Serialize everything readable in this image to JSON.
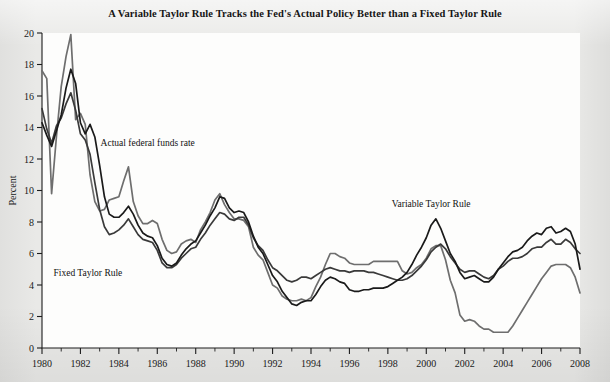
{
  "title": "A Variable Taylor Rule Tracks the Fed's Actual Policy Better than a Fixed Taylor Rule",
  "axes": {
    "ylabel": "Percent",
    "ylim": [
      0,
      20
    ],
    "yticks": [
      0,
      2,
      4,
      6,
      8,
      10,
      12,
      14,
      16,
      18,
      20
    ],
    "ytick_labels": [
      "0",
      "2",
      "4",
      "6",
      "8",
      "10",
      "12",
      "14",
      "16",
      "18",
      "20"
    ],
    "xlim": [
      1980,
      2008
    ],
    "xticks": [
      1980,
      1982,
      1984,
      1986,
      1988,
      1990,
      1992,
      1994,
      1996,
      1998,
      2000,
      2002,
      2004,
      2006,
      2008
    ],
    "xtick_labels": [
      "1980",
      "1982",
      "1984",
      "1986",
      "1988",
      "1990",
      "1992",
      "1994",
      "1996",
      "1998",
      "2000",
      "2002",
      "2004",
      "2006",
      "2008"
    ],
    "xminor_step": 1,
    "grid": false
  },
  "annotations": [
    {
      "name": "actual-federal-funds-rate",
      "text": "Actual federal funds rate",
      "x": 1983.05,
      "y": 12.85
    },
    {
      "name": "fixed-taylor-rule",
      "text": "Fixed Taylor Rule",
      "x": 1980.6,
      "y": 4.55
    },
    {
      "name": "variable-taylor-rule",
      "text": "Variable Taylor Rule",
      "x": 1998.2,
      "y": 8.95
    }
  ],
  "colors": {
    "actual_federal_funds_rate": "#6e6e6e",
    "fixed_taylor_rule": "#3a3a3a",
    "variable_taylor_rule": "#1a1a1a",
    "axis": "#1d1d1d",
    "page_background": "#e9e9e7",
    "plot_background": "#fdfdfc"
  },
  "chart_data": {
    "type": "line",
    "title": "A Variable Taylor Rule Tracks the Fed's Actual Policy Better than a Fixed Taylor Rule",
    "xlabel": "",
    "ylabel": "Percent",
    "xlim": [
      1980,
      2008
    ],
    "ylim": [
      0,
      20
    ],
    "grid": false,
    "legend": "inline-annotations",
    "x": [
      1980.0,
      1980.25,
      1980.5,
      1980.75,
      1981.0,
      1981.25,
      1981.5,
      1981.75,
      1982.0,
      1982.25,
      1982.5,
      1982.75,
      1983.0,
      1983.25,
      1983.5,
      1983.75,
      1984.0,
      1984.25,
      1984.5,
      1984.75,
      1985.0,
      1985.25,
      1985.5,
      1985.75,
      1986.0,
      1986.25,
      1986.5,
      1986.75,
      1987.0,
      1987.25,
      1987.5,
      1987.75,
      1988.0,
      1988.25,
      1988.5,
      1988.75,
      1989.0,
      1989.25,
      1989.5,
      1989.75,
      1990.0,
      1990.25,
      1990.5,
      1990.75,
      1991.0,
      1991.25,
      1991.5,
      1991.75,
      1992.0,
      1992.25,
      1992.5,
      1992.75,
      1993.0,
      1993.25,
      1993.5,
      1993.75,
      1994.0,
      1994.25,
      1994.5,
      1994.75,
      1995.0,
      1995.25,
      1995.5,
      1995.75,
      1996.0,
      1996.25,
      1996.5,
      1996.75,
      1997.0,
      1997.25,
      1997.5,
      1997.75,
      1998.0,
      1998.25,
      1998.5,
      1998.75,
      1999.0,
      1999.25,
      1999.5,
      1999.75,
      2000.0,
      2000.25,
      2000.5,
      2000.75,
      2001.0,
      2001.25,
      2001.5,
      2001.75,
      2002.0,
      2002.25,
      2002.5,
      2002.75,
      2003.0,
      2003.25,
      2003.5,
      2003.75,
      2004.0,
      2004.25,
      2004.5,
      2004.75,
      2005.0,
      2005.25,
      2005.5,
      2005.75,
      2006.0,
      2006.25,
      2006.5,
      2006.75,
      2007.0,
      2007.25,
      2007.5,
      2007.75,
      2008.0
    ],
    "series": [
      {
        "name": "Actual federal funds rate",
        "color": "#6e6e6e",
        "values": [
          17.6,
          17.1,
          9.8,
          13.4,
          16.6,
          18.5,
          19.9,
          14.5,
          14.9,
          14.2,
          11.0,
          9.3,
          8.7,
          8.8,
          9.4,
          9.5,
          9.6,
          10.6,
          11.5,
          9.3,
          8.4,
          7.9,
          7.9,
          8.1,
          7.9,
          6.9,
          6.2,
          6.0,
          6.1,
          6.6,
          6.8,
          6.9,
          6.7,
          7.5,
          8.0,
          8.6,
          9.4,
          9.8,
          9.1,
          8.6,
          8.2,
          8.2,
          8.1,
          7.7,
          6.4,
          5.9,
          5.6,
          4.8,
          4.0,
          3.8,
          3.3,
          3.1,
          3.0,
          3.0,
          3.1,
          3.0,
          3.2,
          3.9,
          4.5,
          5.3,
          6.0,
          6.0,
          5.8,
          5.7,
          5.4,
          5.3,
          5.3,
          5.3,
          5.3,
          5.5,
          5.5,
          5.5,
          5.5,
          5.5,
          5.5,
          4.9,
          4.7,
          4.8,
          5.1,
          5.3,
          5.7,
          6.3,
          6.5,
          6.5,
          5.6,
          4.3,
          3.5,
          2.1,
          1.7,
          1.8,
          1.7,
          1.4,
          1.2,
          1.2,
          1.0,
          1.0,
          1.0,
          1.0,
          1.4,
          1.9,
          2.4,
          2.9,
          3.4,
          3.9,
          4.4,
          4.8,
          5.2,
          5.3,
          5.3,
          5.3,
          5.1,
          4.5,
          3.5
        ]
      },
      {
        "name": "Fixed Taylor Rule",
        "color": "#3a3a3a",
        "values": [
          15.2,
          13.9,
          13.0,
          14.1,
          14.6,
          15.5,
          16.2,
          15.1,
          13.6,
          13.2,
          12.3,
          10.5,
          8.8,
          7.7,
          7.2,
          7.3,
          7.5,
          7.8,
          8.2,
          7.7,
          7.2,
          6.9,
          6.8,
          6.7,
          6.2,
          5.4,
          5.1,
          5.1,
          5.3,
          5.7,
          6.0,
          6.3,
          6.4,
          6.9,
          7.3,
          7.8,
          8.2,
          8.6,
          8.5,
          8.2,
          8.1,
          8.3,
          8.3,
          7.8,
          7.0,
          6.5,
          6.2,
          5.6,
          5.1,
          4.9,
          4.6,
          4.3,
          4.2,
          4.3,
          4.5,
          4.5,
          4.4,
          4.6,
          4.8,
          5.0,
          5.1,
          5.0,
          4.9,
          4.9,
          4.8,
          4.9,
          4.9,
          4.9,
          4.8,
          4.8,
          4.7,
          4.6,
          4.5,
          4.4,
          4.3,
          4.3,
          4.4,
          4.6,
          4.9,
          5.2,
          5.6,
          6.1,
          6.4,
          6.6,
          6.3,
          5.8,
          5.4,
          5.0,
          4.8,
          4.9,
          4.9,
          4.7,
          4.5,
          4.4,
          4.6,
          5.0,
          5.2,
          5.5,
          5.7,
          5.7,
          5.8,
          6.0,
          6.3,
          6.4,
          6.4,
          6.7,
          6.9,
          6.6,
          6.6,
          6.9,
          6.7,
          6.3,
          6.0
        ]
      },
      {
        "name": "Variable Taylor Rule",
        "color": "#1a1a1a",
        "values": [
          14.3,
          13.5,
          12.8,
          13.8,
          14.8,
          16.5,
          17.7,
          16.8,
          14.3,
          13.6,
          14.2,
          13.4,
          11.6,
          9.6,
          8.5,
          8.3,
          8.3,
          8.6,
          9.0,
          8.5,
          7.8,
          7.3,
          7.1,
          7.0,
          6.5,
          5.7,
          5.3,
          5.2,
          5.4,
          5.9,
          6.3,
          6.6,
          6.8,
          7.3,
          7.8,
          8.4,
          8.9,
          9.6,
          9.5,
          8.9,
          8.6,
          8.7,
          8.6,
          8.0,
          7.1,
          6.4,
          6.0,
          5.3,
          4.6,
          4.2,
          3.6,
          3.2,
          2.8,
          2.7,
          2.9,
          3.0,
          3.0,
          3.4,
          3.9,
          4.3,
          4.5,
          4.4,
          4.2,
          4.1,
          3.7,
          3.6,
          3.6,
          3.7,
          3.7,
          3.8,
          3.8,
          3.8,
          3.9,
          4.1,
          4.3,
          4.5,
          4.8,
          5.3,
          5.9,
          6.4,
          7.0,
          7.8,
          8.2,
          7.6,
          6.8,
          6.0,
          5.5,
          4.8,
          4.4,
          4.5,
          4.6,
          4.4,
          4.2,
          4.2,
          4.5,
          5.0,
          5.4,
          5.8,
          6.1,
          6.2,
          6.4,
          6.8,
          7.1,
          7.3,
          7.2,
          7.6,
          7.7,
          7.3,
          7.4,
          7.6,
          7.4,
          6.6,
          5.0
        ]
      }
    ]
  }
}
